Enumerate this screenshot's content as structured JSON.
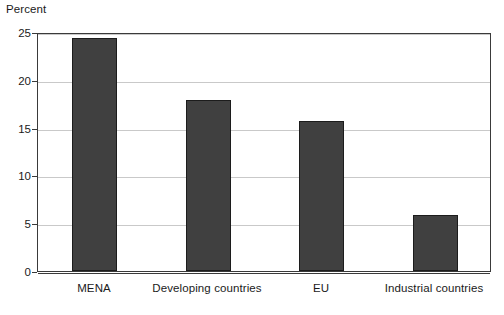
{
  "chart_data": {
    "type": "bar",
    "title": "",
    "subtitle": "",
    "xlabel": "",
    "ylabel": "Percent",
    "ylim": [
      0,
      25
    ],
    "yticks": [
      0,
      5,
      10,
      15,
      20,
      25
    ],
    "ytick_labels": [
      "0",
      "5",
      "10",
      "15",
      "20",
      "25"
    ],
    "grid": true,
    "legend": false,
    "legend_position": "none",
    "categories": [
      "MENA",
      "Developing countries",
      "EU",
      "Industrial countries"
    ],
    "values": [
      24.4,
      17.9,
      15.7,
      5.9
    ],
    "series": [
      {
        "name": "Percent",
        "values": [
          24.4,
          17.9,
          15.7,
          5.9
        ]
      }
    ],
    "colors": {
      "bar_fill": "#404040",
      "bar_edge": "#1c1c1c",
      "gridline": "#c9c9c9",
      "axis": "#3a3a3a",
      "text": "#1a1a1a",
      "background": "#ffffff"
    }
  }
}
